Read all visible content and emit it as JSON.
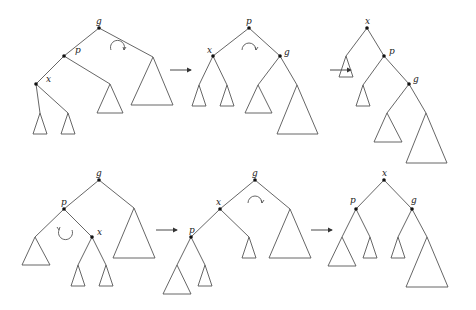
{
  "figure": {
    "rows": [
      {
        "name": "zig-zig",
        "stages": [
          {
            "labels": {
              "g": "g",
              "p": "p",
              "x": "x"
            }
          },
          {
            "labels": {
              "p": "p",
              "x": "x",
              "g": "g"
            }
          },
          {
            "labels": {
              "x": "x",
              "p": "p",
              "g": "g"
            }
          }
        ]
      },
      {
        "name": "zig-zag",
        "stages": [
          {
            "labels": {
              "g": "g",
              "p": "p",
              "x": "x"
            }
          },
          {
            "labels": {
              "g": "g",
              "x": "x",
              "p": "p"
            }
          },
          {
            "labels": {
              "x": "x",
              "p": "p",
              "g": "g"
            }
          }
        ]
      }
    ],
    "colors": {
      "line": "#555555",
      "node": "#111111",
      "background": "#ffffff"
    }
  }
}
